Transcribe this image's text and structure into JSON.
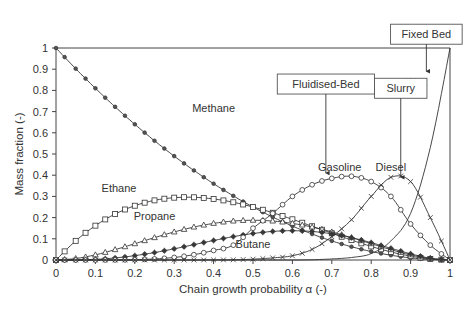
{
  "chart_data": {
    "type": "line",
    "title": "",
    "xlabel": "Chain growth probability α (-)",
    "ylabel": "Mass fraction (-)",
    "xlim": [
      0,
      1
    ],
    "ylim": [
      0,
      1
    ],
    "grid": false,
    "legend": "none (inline labels)",
    "x_ticks": [
      "0",
      "0.1",
      "0.2",
      "0.3",
      "0.4",
      "0.5",
      "0.6",
      "0.7",
      "0.8",
      "0.9",
      "1"
    ],
    "y_ticks": [
      "0",
      "0.1",
      "0.2",
      "0.3",
      "0.4",
      "0.5",
      "0.6",
      "0.7",
      "0.8",
      "0.9",
      "1"
    ],
    "x": [
      0,
      0.05,
      0.1,
      0.15,
      0.2,
      0.25,
      0.3,
      0.35,
      0.4,
      0.45,
      0.5,
      0.55,
      0.6,
      0.65,
      0.7,
      0.75,
      0.8,
      0.85,
      0.9,
      0.95,
      1
    ],
    "series": [
      {
        "name": "Methane",
        "marker": "dot",
        "label_pos": [
          0.4,
          0.7
        ],
        "values": [
          1,
          0.9025,
          0.81,
          0.7225,
          0.64,
          0.5625,
          0.49,
          0.4225,
          0.36,
          0.3025,
          0.25,
          0.2025,
          0.16,
          0.1225,
          0.09,
          0.0625,
          0.04,
          0.0225,
          0.01,
          0.0025,
          0
        ]
      },
      {
        "name": "Ethane",
        "marker": "square",
        "label_pos": [
          0.16,
          0.32
        ],
        "values": [
          0,
          0.0903,
          0.162,
          0.2168,
          0.256,
          0.2813,
          0.294,
          0.2958,
          0.288,
          0.2723,
          0.25,
          0.2228,
          0.192,
          0.1593,
          0.126,
          0.0938,
          0.064,
          0.0383,
          0.018,
          0.0048,
          0
        ]
      },
      {
        "name": "Propane",
        "marker": "triangle",
        "label_pos": [
          0.25,
          0.19
        ],
        "values": [
          0,
          0.0068,
          0.0243,
          0.0488,
          0.0768,
          0.1055,
          0.1323,
          0.1553,
          0.1728,
          0.1838,
          0.1875,
          0.1838,
          0.1728,
          0.1553,
          0.1323,
          0.1055,
          0.0768,
          0.0488,
          0.0243,
          0.0068,
          0
        ]
      },
      {
        "name": "Butane",
        "marker": "star",
        "label_pos": [
          0.5,
          0.055
        ],
        "values": [
          0,
          0.0005,
          0.0032,
          0.0098,
          0.0205,
          0.0352,
          0.0529,
          0.0725,
          0.0922,
          0.1103,
          0.125,
          0.1348,
          0.1382,
          0.1346,
          0.1235,
          0.1055,
          0.0819,
          0.0553,
          0.0292,
          0.0086,
          0
        ]
      },
      {
        "name": "Gasoline",
        "marker": "circle",
        "label_pos": [
          0.72,
          0.42
        ],
        "values": [
          0,
          0,
          0,
          0.0003,
          0.0015,
          0.005,
          0.012,
          0.025,
          0.045,
          0.07,
          0.15,
          0.22,
          0.3,
          0.355,
          0.385,
          0.395,
          0.37,
          0.3,
          0.17,
          0.07,
          0
        ]
      },
      {
        "name": "Diesel",
        "marker": "x",
        "label_pos": [
          0.85,
          0.42
        ],
        "values": [
          0,
          0,
          0,
          0,
          0,
          0,
          0,
          0,
          0.0005,
          0.001,
          0.004,
          0.01,
          0.02,
          0.05,
          0.11,
          0.19,
          0.3,
          0.39,
          0.37,
          0.2,
          0
        ]
      },
      {
        "name": "Wax",
        "marker": "none",
        "label_pos": [
          0.915,
          0.82
        ],
        "values": [
          0,
          0,
          0,
          0,
          0,
          0,
          0,
          0,
          0,
          0,
          0,
          0,
          0,
          0.001,
          0.005,
          0.012,
          0.03,
          0.09,
          0.22,
          0.53,
          1
        ]
      }
    ],
    "annotations": [
      {
        "text": "Fluidised-Bed",
        "box_x": 0.685,
        "box_y": 0.83,
        "arrow_to": [
          0.685,
          0.41
        ]
      },
      {
        "text": "Slurry",
        "box_x": 0.875,
        "box_y": 0.81,
        "arrow_to": [
          0.875,
          0.39
        ]
      },
      {
        "text": "Fixed Bed",
        "box_x": 0.94,
        "box_y": 1.065,
        "arrow_to": [
          0.94,
          0.89
        ]
      }
    ]
  }
}
